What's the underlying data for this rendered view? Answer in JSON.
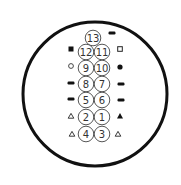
{
  "diagram": {
    "type": "connector-pinout",
    "outer": {
      "cx": 95,
      "cy": 94,
      "r": 72,
      "stroke": "#111111"
    },
    "pin_radius": 7.8,
    "pins": [
      {
        "label": "13",
        "cx": 93,
        "cy": 38
      },
      {
        "label": "12",
        "cx": 86,
        "cy": 52
      },
      {
        "label": "11",
        "cx": 102,
        "cy": 52
      },
      {
        "label": "9",
        "cx": 86,
        "cy": 68
      },
      {
        "label": "10",
        "cx": 102,
        "cy": 68
      },
      {
        "label": "8",
        "cx": 86,
        "cy": 84
      },
      {
        "label": "7",
        "cx": 102,
        "cy": 84
      },
      {
        "label": "5",
        "cx": 86,
        "cy": 100
      },
      {
        "label": "6",
        "cx": 102,
        "cy": 100
      },
      {
        "label": "2",
        "cx": 86,
        "cy": 117
      },
      {
        "label": "1",
        "cx": 102,
        "cy": 117
      },
      {
        "label": "4",
        "cx": 86,
        "cy": 134
      },
      {
        "label": "3",
        "cx": 102,
        "cy": 134
      }
    ],
    "markers": [
      {
        "shape": "bar",
        "x": 112,
        "y": 33,
        "pin": "13"
      },
      {
        "shape": "square-filled",
        "x": 71,
        "y": 49,
        "pin": "12"
      },
      {
        "shape": "square-open",
        "x": 120,
        "y": 49,
        "pin": "11"
      },
      {
        "shape": "circle-open",
        "x": 71,
        "y": 66,
        "pin": "9"
      },
      {
        "shape": "circle-filled",
        "x": 120,
        "y": 67,
        "pin": "10"
      },
      {
        "shape": "bar",
        "x": 71,
        "y": 83,
        "pin": "8"
      },
      {
        "shape": "bar",
        "x": 121,
        "y": 84,
        "pin": "7"
      },
      {
        "shape": "bar",
        "x": 71,
        "y": 99,
        "pin": "5"
      },
      {
        "shape": "bar",
        "x": 121,
        "y": 100,
        "pin": "6"
      },
      {
        "shape": "triangle-open",
        "x": 71,
        "y": 116,
        "pin": "2"
      },
      {
        "shape": "triangle-filled",
        "x": 120,
        "y": 116,
        "pin": "1"
      },
      {
        "shape": "triangle-open",
        "x": 72,
        "y": 134,
        "pin": "4"
      },
      {
        "shape": "triangle-open",
        "x": 118,
        "y": 134,
        "pin": "3"
      }
    ]
  }
}
